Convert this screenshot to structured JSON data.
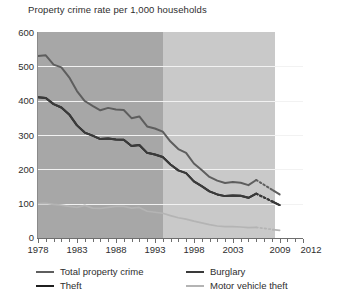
{
  "title": "Property crime rate per 1,000 households",
  "axes": {
    "y_ticks": [
      "600",
      "500",
      "400",
      "300",
      "200",
      "100",
      "0"
    ],
    "x_labels": [
      "1978",
      "1983",
      "1988",
      "1993",
      "1998",
      "2003",
      "2009",
      "2012"
    ]
  },
  "legend": {
    "items": [
      {
        "label": "Total property crime",
        "color": "#5e5e5e"
      },
      {
        "label": "Burglary",
        "color": "#3a3a3a"
      },
      {
        "label": "Theft",
        "color": "#1f1f1f"
      },
      {
        "label": "Motor vehicle theft",
        "color": "#b4b4b4"
      }
    ]
  },
  "chart_data": {
    "type": "line",
    "title": "Property crime rate per 1,000 households",
    "xlabel": "",
    "ylabel": "Rate per 1,000 households",
    "xlim": [
      1978,
      2012
    ],
    "ylim": [
      0,
      600
    ],
    "grid": true,
    "legend_position": "bottom",
    "x": [
      1978,
      1979,
      1980,
      1981,
      1982,
      1983,
      1984,
      1985,
      1986,
      1987,
      1988,
      1989,
      1990,
      1991,
      1992,
      1993,
      1994,
      1995,
      1996,
      1997,
      1998,
      1999,
      2000,
      2001,
      2002,
      2003,
      2004,
      2005,
      2006,
      2009
    ],
    "series": [
      {
        "name": "Total property crime",
        "color": "#5e5e5e",
        "values": [
          530,
          532,
          505,
          497,
          468,
          428,
          399,
          385,
          372,
          379,
          374,
          373,
          349,
          354,
          325,
          319,
          310,
          281,
          259,
          248,
          217,
          198,
          178,
          167,
          160,
          163,
          161,
          154,
          169,
          127
        ],
        "dashed_from": 2006,
        "dashed_to": 2009
      },
      {
        "name": "Theft",
        "color": "#1f1f1f",
        "values": [
          410,
          408,
          390,
          380,
          360,
          328,
          307,
          298,
          288,
          290,
          287,
          286,
          268,
          271,
          248,
          243,
          236,
          214,
          197,
          189,
          165,
          151,
          136,
          127,
          122,
          124,
          123,
          117,
          129,
          96
        ],
        "dashed_from": 2006,
        "dashed_to": 2009
      },
      {
        "name": "Burglary",
        "color": "#3a3a3a",
        "values": [
          410,
          408,
          390,
          380,
          360,
          328,
          307,
          298,
          288,
          290,
          287,
          286,
          268,
          271,
          248,
          243,
          236,
          214,
          197,
          189,
          165,
          151,
          136,
          127,
          122,
          124,
          123,
          117,
          129,
          96
        ],
        "note": "overlaps theft series",
        "dashed_from": 2006,
        "dashed_to": 2009
      },
      {
        "name": "Motor vehicle theft",
        "color": "#b4b4b4",
        "values": [
          100,
          101,
          98,
          96,
          92,
          89,
          95,
          87,
          86,
          89,
          92,
          92,
          87,
          89,
          78,
          75,
          72,
          65,
          59,
          55,
          49,
          44,
          39,
          35,
          33,
          33,
          32,
          30,
          31,
          22
        ],
        "dashed_from": 2006,
        "dashed_to": 2009
      }
    ]
  }
}
